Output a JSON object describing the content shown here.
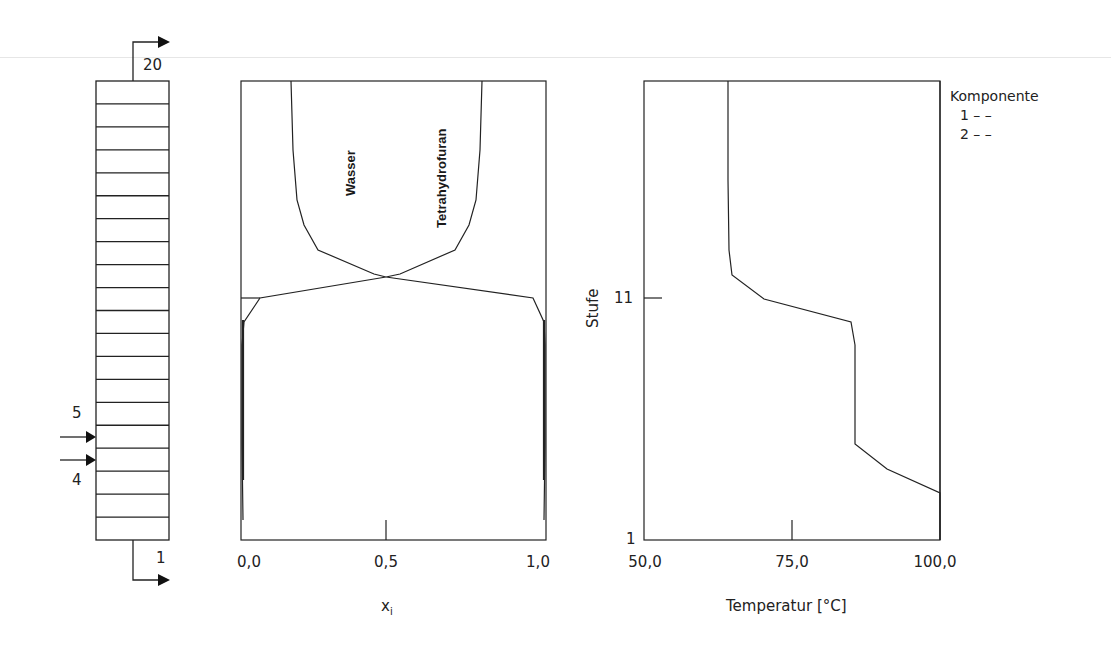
{
  "chart_data": [
    {
      "type": "diagram",
      "title": "Kolonne",
      "stages": 20,
      "top_stage_label": "20",
      "bottom_stage_label": "1",
      "feed_labels": [
        "5",
        "4"
      ],
      "feed_stages": [
        5,
        4
      ]
    },
    {
      "type": "line",
      "title": "",
      "xlabel": "x_i",
      "ylabel": "",
      "xlim": [
        0.0,
        1.0
      ],
      "ylim": [
        1,
        20
      ],
      "x_ticks": [
        "0,0",
        "0,5",
        "1,0"
      ],
      "series": [
        {
          "name": "Wasser",
          "points": [
            [
              0.17,
              20
            ],
            [
              0.18,
              16
            ],
            [
              0.2,
              14
            ],
            [
              0.24,
              13
            ],
            [
              0.28,
              12.5
            ],
            [
              0.43,
              12.0
            ],
            [
              0.5,
              11.9
            ],
            [
              0.05,
              11.0
            ],
            [
              0.02,
              10.0
            ],
            [
              0.01,
              9.0
            ],
            [
              0.0,
              5.0
            ],
            [
              0.0,
              1.0
            ]
          ]
        },
        {
          "name": "Tetrahydrofuran",
          "points": [
            [
              0.83,
              20
            ],
            [
              0.82,
              16
            ],
            [
              0.8,
              14
            ],
            [
              0.76,
              13
            ],
            [
              0.72,
              12.5
            ],
            [
              0.57,
              12.0
            ],
            [
              0.5,
              11.9
            ],
            [
              0.95,
              11.0
            ],
            [
              0.98,
              10.0
            ],
            [
              0.99,
              9.0
            ],
            [
              1.0,
              5.0
            ],
            [
              1.0,
              1.0
            ]
          ]
        }
      ],
      "annotations": [
        "Wasser",
        "Tetrahydrofuran"
      ]
    },
    {
      "type": "line",
      "title": "",
      "xlabel": "Temperatur [°C]",
      "ylabel": "Stufe",
      "xlim": [
        50.0,
        100.0
      ],
      "ylim": [
        1,
        20
      ],
      "x_ticks": [
        "50,0",
        "75,0",
        "100,0"
      ],
      "y_ticks": [
        "1",
        "11"
      ],
      "series": [
        {
          "name": "Temperatur",
          "points": [
            [
              64.2,
              20
            ],
            [
              64.2,
              16
            ],
            [
              64.4,
              13
            ],
            [
              65.0,
              12.0
            ],
            [
              70.3,
              11.0
            ],
            [
              85.0,
              10.0
            ],
            [
              85.6,
              9.1
            ],
            [
              85.6,
              5.0
            ],
            [
              91.4,
              3.9
            ],
            [
              100.0,
              2.95
            ],
            [
              100.0,
              1.0
            ]
          ]
        }
      ],
      "legend": {
        "title": "Komponente",
        "entries": [
          {
            "label": "1",
            "style": "--"
          },
          {
            "label": "2",
            "style": "--"
          }
        ],
        "position": "top-right"
      }
    }
  ],
  "column": {
    "top_label": "20",
    "bottom_label": "1",
    "feed_label_upper": "5",
    "feed_label_lower": "4"
  },
  "middle": {
    "x_ticks": [
      "0,0",
      "0,5",
      "1,0"
    ],
    "xlabel_main": "x",
    "xlabel_sub": "i",
    "label_water": "Wasser",
    "label_thf": "Tetrahydrofuran"
  },
  "right": {
    "x_ticks": [
      "50,0",
      "75,0",
      "100,0"
    ],
    "y_tick_low": "1",
    "y_tick_mid": "11",
    "ylabel": "Stufe",
    "xlabel": "Temperatur [°C]"
  },
  "legend": {
    "title": "Komponente",
    "row1": "1 – –",
    "row2": "2 – –"
  }
}
